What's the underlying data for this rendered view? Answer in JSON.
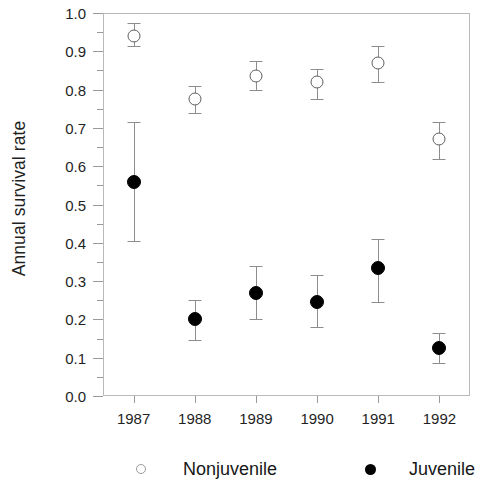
{
  "chart_data": {
    "type": "scatter",
    "title": "",
    "xlabel": "",
    "ylabel": "Annual survival rate",
    "categories": [
      "1987",
      "1988",
      "1989",
      "1990",
      "1991",
      "1992"
    ],
    "ylim": [
      0.0,
      1.0
    ],
    "ytick_labels": [
      "0.0",
      "0.1",
      "0.2",
      "0.3",
      "0.4",
      "0.5",
      "0.6",
      "0.7",
      "0.8",
      "0.9",
      "1.0"
    ],
    "ytick_values": [
      0.0,
      0.1,
      0.2,
      0.3,
      0.4,
      0.5,
      0.6,
      0.7,
      0.8,
      0.9,
      1.0
    ],
    "grid": false,
    "legend_position": "bottom",
    "series": [
      {
        "name": "Nonjuvenile",
        "marker": "open-circle",
        "color": "#ffffff",
        "edge_color": "#5e5e5e",
        "values": [
          0.94,
          0.775,
          0.835,
          0.82,
          0.87,
          0.67
        ],
        "err_low": [
          0.915,
          0.74,
          0.8,
          0.775,
          0.82,
          0.62
        ],
        "err_high": [
          0.975,
          0.81,
          0.875,
          0.855,
          0.915,
          0.715
        ]
      },
      {
        "name": "Juvenile",
        "marker": "filled-circle",
        "color": "#000000",
        "edge_color": "#000000",
        "values": [
          0.56,
          0.2,
          0.27,
          0.245,
          0.335,
          0.125
        ],
        "err_low": [
          0.405,
          0.145,
          0.2,
          0.18,
          0.245,
          0.085
        ],
        "err_high": [
          0.715,
          0.25,
          0.34,
          0.315,
          0.41,
          0.165
        ]
      }
    ]
  },
  "legend": {
    "items": [
      {
        "label": "Nonjuvenile",
        "marker": "open-circle"
      },
      {
        "label": "Juvenile",
        "marker": "filled-circle"
      }
    ]
  }
}
